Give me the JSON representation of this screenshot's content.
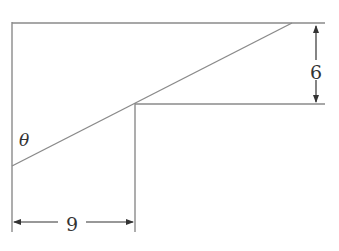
{
  "diagram": {
    "type": "geometry",
    "angle_label": "θ",
    "dimension_height": "6",
    "dimension_width": "9",
    "colors": {
      "line": "#8a8a8a",
      "text": "#333333",
      "background": "#ffffff"
    }
  }
}
